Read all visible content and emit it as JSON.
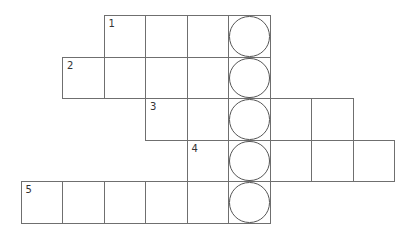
{
  "puzzle": {
    "type": "crossword",
    "highlight_column_label": "circled letters",
    "rows": [
      {
        "clue_number": "1",
        "start_col": 2,
        "length": 4
      },
      {
        "clue_number": "2",
        "start_col": 1,
        "length": 5
      },
      {
        "clue_number": "3",
        "start_col": 3,
        "length": 5
      },
      {
        "clue_number": "4",
        "start_col": 4,
        "length": 5
      },
      {
        "clue_number": "5",
        "start_col": 0,
        "length": 6
      }
    ],
    "circled_col": 5,
    "cells_filled": []
  }
}
